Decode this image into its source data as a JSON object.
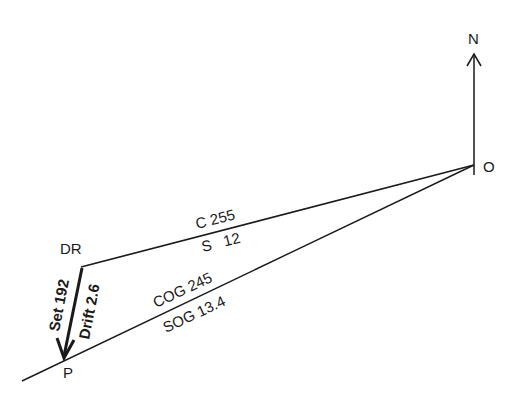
{
  "diagram": {
    "type": "current-vector-triangle",
    "points": {
      "origin": {
        "label": "O"
      },
      "dead_reckoning": {
        "label": "DR"
      },
      "position": {
        "label": "P"
      },
      "north": {
        "label": "N"
      }
    },
    "course_vector": {
      "course_label": "C 255",
      "speed_label": "S   12"
    },
    "ground_vector": {
      "cog_label": "COG 245",
      "sog_label": "SOG 13.4"
    },
    "current_vector": {
      "set_label": "Set 192",
      "drift_label": "Drift 2.6"
    },
    "colors": {
      "line": "#1a1a1a",
      "background": "#ffffff"
    }
  }
}
